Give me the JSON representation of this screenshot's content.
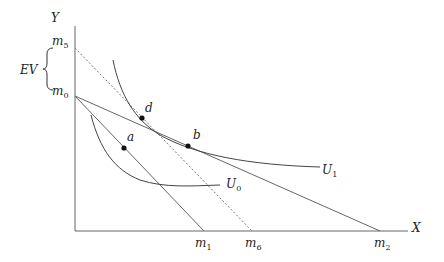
{
  "diagram": {
    "axes": {
      "x_label": "X",
      "y_label": "Y"
    },
    "y_ticks": {
      "m5": "m",
      "m5_sub": "5",
      "m0": "m",
      "m0_sub": "0"
    },
    "x_ticks": {
      "m1": "m",
      "m1_sub": "1",
      "m6": "m",
      "m6_sub": "6",
      "m2": "m",
      "m2_sub": "2"
    },
    "ev_label": "EV",
    "curves": {
      "u0": "U",
      "u0_sub": "0",
      "u1": "U",
      "u1_sub": "1"
    },
    "points": {
      "a": "a",
      "b": "b",
      "d": "d"
    },
    "colors": {
      "line": "#555555",
      "curve": "#444444",
      "point": "#111111"
    }
  }
}
